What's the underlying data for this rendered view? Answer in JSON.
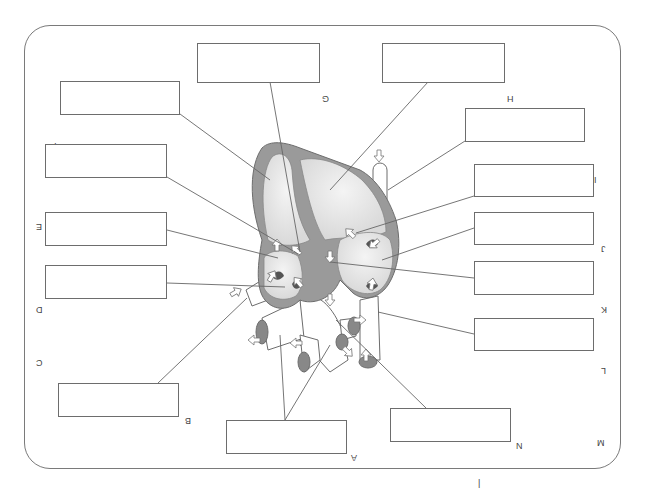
{
  "worksheet": {
    "type": "heart-anatomy-labeling",
    "orientation": "rotated-180",
    "colors": {
      "wall": "#9a9a9a",
      "chamber": "#e2e2e2",
      "vessel": "#ffffff",
      "outline": "#6d6d6d"
    }
  },
  "labels": [
    {
      "letter": "A",
      "answer": ""
    },
    {
      "letter": "B",
      "answer": ""
    },
    {
      "letter": "C",
      "answer": ""
    },
    {
      "letter": "D",
      "answer": ""
    },
    {
      "letter": "E",
      "answer": ""
    },
    {
      "letter": "F",
      "answer": ""
    },
    {
      "letter": "G",
      "answer": ""
    },
    {
      "letter": "H",
      "answer": ""
    },
    {
      "letter": "I",
      "answer": ""
    },
    {
      "letter": "J",
      "answer": ""
    },
    {
      "letter": "K",
      "answer": ""
    },
    {
      "letter": "L",
      "answer": ""
    },
    {
      "letter": "M",
      "answer": ""
    },
    {
      "letter": "N",
      "answer": ""
    }
  ],
  "footer_mark": "|"
}
